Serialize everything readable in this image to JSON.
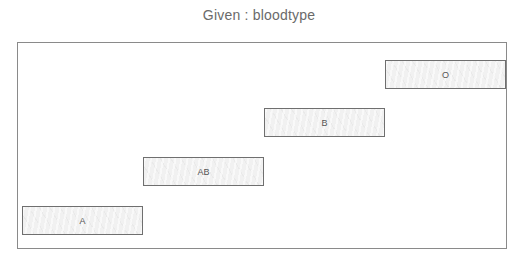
{
  "title": "Given : bloodtype",
  "diagram": {
    "variable": "bloodtype",
    "condition": "Given",
    "bars": [
      {
        "label": "A",
        "level": 1,
        "x": 22,
        "y": 206
      },
      {
        "label": "AB",
        "level": 2,
        "x": 143,
        "y": 157
      },
      {
        "label": "B",
        "level": 3,
        "x": 264,
        "y": 108
      },
      {
        "label": "O",
        "level": 4,
        "x": 385,
        "y": 60
      }
    ]
  },
  "colors": {
    "frame": "#8a8a8a",
    "bar_border": "#6f6f6f",
    "bar_fill": "#f1f1f1",
    "text": "#555555",
    "title": "#6a6a6a"
  }
}
